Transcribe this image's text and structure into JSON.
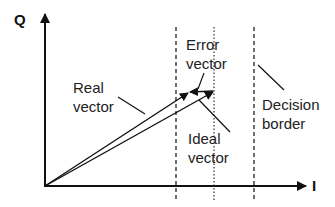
{
  "diagram": {
    "type": "IQ constellation vector diagram",
    "axes": {
      "vertical_label": "Q",
      "horizontal_label": "I"
    },
    "labels": {
      "real_vector": [
        "Real",
        "vector"
      ],
      "error_vector": [
        "Error",
        "vector"
      ],
      "ideal_vector": [
        "Ideal",
        "vector"
      ],
      "decision_border": [
        "Decision",
        "border"
      ]
    },
    "elements": [
      {
        "name": "real-vector",
        "style": "solid arrow",
        "from": "origin",
        "to": "near error vector tail"
      },
      {
        "name": "ideal-vector",
        "style": "solid arrow",
        "from": "origin",
        "to": "on dotted line"
      },
      {
        "name": "error-vector",
        "style": "solid arrow",
        "from": "ideal vector tip",
        "to": "real vector tip"
      },
      {
        "name": "decision-border-left",
        "style": "dashed vertical line"
      },
      {
        "name": "ideal-reference-line",
        "style": "dotted vertical line"
      },
      {
        "name": "decision-border-right",
        "style": "dashed vertical line"
      }
    ],
    "colors": {
      "line": "#1a1a1a",
      "background": "#ffffff"
    }
  }
}
